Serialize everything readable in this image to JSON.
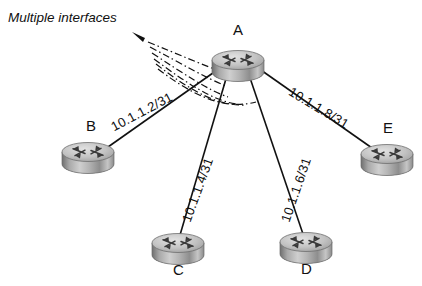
{
  "diagram": {
    "background_color": "#ffffff",
    "line_color": "#111111",
    "annotation": {
      "text": "Multiple interfaces",
      "style": "italic",
      "pointer": "dash-dot-fan-with-arrowhead",
      "arrow_icon": "arrowhead-icon"
    },
    "nodes": [
      {
        "id": "A",
        "label": "A",
        "icon": "router-icon",
        "x": 238,
        "y": 60,
        "label_x": 233,
        "label_y": 22
      },
      {
        "id": "B",
        "label": "B",
        "icon": "router-icon",
        "x": 88,
        "y": 152,
        "label_x": 86,
        "label_y": 118
      },
      {
        "id": "C",
        "label": "C",
        "icon": "router-icon",
        "x": 178,
        "y": 243,
        "label_x": 173,
        "label_y": 262
      },
      {
        "id": "D",
        "label": "D",
        "icon": "router-icon",
        "x": 306,
        "y": 242,
        "label_x": 301,
        "label_y": 261
      },
      {
        "id": "E",
        "label": "E",
        "icon": "router-icon",
        "x": 387,
        "y": 154,
        "label_x": 383,
        "label_y": 120
      }
    ],
    "links": [
      {
        "from": "A",
        "to": "B",
        "label": "10.1.1.2/31",
        "label_x": 112,
        "label_y": 120,
        "rotation": -28
      },
      {
        "from": "A",
        "to": "C",
        "label": "10.1.1.4/31",
        "label_x": 186,
        "label_y": 214,
        "rotation": -70
      },
      {
        "from": "A",
        "to": "D",
        "label": "10.1.1.6/31",
        "label_x": 285,
        "label_y": 214,
        "rotation": -71
      },
      {
        "from": "A",
        "to": "E",
        "label": "10.1.1.8/31",
        "label_x": 290,
        "label_y": 83,
        "rotation": 31
      }
    ]
  }
}
